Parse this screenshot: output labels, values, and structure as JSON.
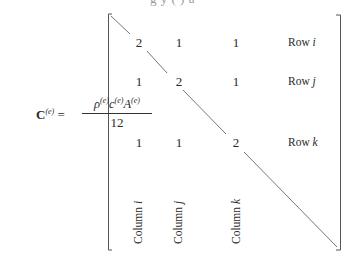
{
  "top_fragment": "g y ( ) a",
  "equation": {
    "lhs_symbol": "C",
    "lhs_superscript": "(e)",
    "equals": "=",
    "numerator": "ρ(e)c(e)A(e)",
    "numerator_parts": [
      {
        "base": "ρ",
        "sup": "(e)"
      },
      {
        "base": "c",
        "sup": "(e)"
      },
      {
        "base": "A",
        "sup": "(e)"
      }
    ],
    "denominator": "12"
  },
  "matrix": {
    "rows": [
      {
        "values": [
          "2",
          "1",
          "1"
        ],
        "label_prefix": "Row ",
        "label_index": "i"
      },
      {
        "values": [
          "1",
          "2",
          "1"
        ],
        "label_prefix": "Row ",
        "label_index": "j"
      },
      {
        "values": [
          "1",
          "1",
          "2"
        ],
        "label_prefix": "Row ",
        "label_index": "k"
      }
    ],
    "columns": [
      {
        "label_prefix": "Column ",
        "label_index": "i"
      },
      {
        "label_prefix": "Column ",
        "label_index": "j"
      },
      {
        "label_prefix": "Column ",
        "label_index": "k"
      }
    ]
  },
  "colors": {
    "ink": "#2a2a2a",
    "line": "#555555",
    "background": "#ffffff"
  }
}
